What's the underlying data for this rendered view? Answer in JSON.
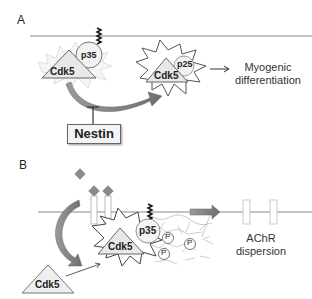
{
  "panel_a": {
    "label": "A",
    "cdk5_label": "Cdk5",
    "p35_label": "p35",
    "cdk5_active_label": "Cdk5",
    "p25_label": "p25",
    "outcome_label_line1": "Myogenic",
    "outcome_label_line2": "differentiation",
    "inhibitor_label": "Nestin"
  },
  "panel_b": {
    "label": "B",
    "cdk5_free_label": "Cdk5",
    "cdk5_complex_label": "Cdk5",
    "p35_label": "p35",
    "phospho_labels": [
      "P",
      "P",
      "P"
    ],
    "outcome_label_line1": "AChR",
    "outcome_label_line2": "dispersion"
  },
  "colors": {
    "membrane": "#888888",
    "arrow_fill": "#7a7a7a",
    "diamond": "#8a8a8a",
    "shape_fill": "#eeeeee",
    "outline": "#555555"
  }
}
